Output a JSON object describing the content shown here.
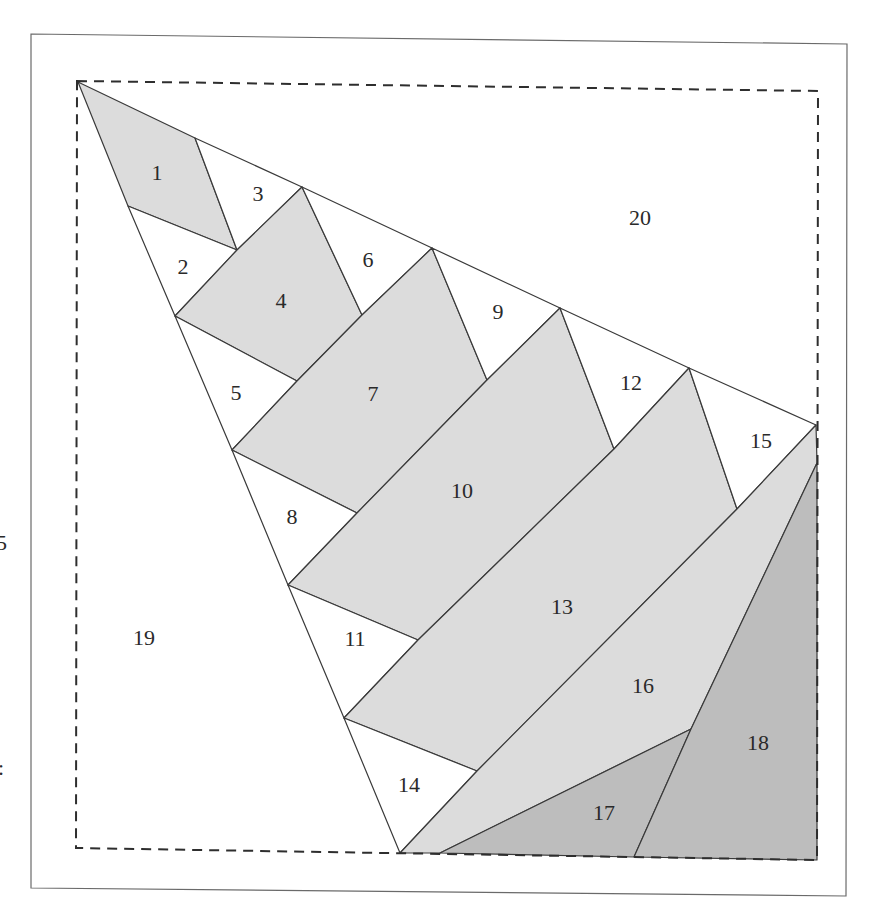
{
  "colors": {
    "white": "#ffffff",
    "light_gray": "#dcdcdc",
    "dark_gray": "#bdbdbd",
    "line": "#3a3a3a",
    "frame": "#6a6a6a"
  },
  "frame": {
    "points": [
      [
        31,
        34
      ],
      [
        847,
        44
      ],
      [
        846,
        896
      ],
      [
        31,
        888
      ]
    ]
  },
  "dashed_square": {
    "points": [
      [
        77,
        81
      ],
      [
        818,
        91
      ],
      [
        817,
        860
      ],
      [
        76,
        848
      ]
    ]
  },
  "edge_glyphs": [
    {
      "text": "5",
      "x": -4,
      "y": 550
    },
    {
      "text": ":",
      "x": -2,
      "y": 775
    }
  ],
  "pieces": [
    {
      "id": "1",
      "label": "1",
      "fill": "light_gray",
      "points": [
        [
          78,
          82
        ],
        [
          195,
          138
        ],
        [
          237,
          250
        ],
        [
          128,
          206
        ]
      ],
      "lx": 157,
      "ly": 172
    },
    {
      "id": "2",
      "label": "2",
      "fill": "white",
      "points": [
        [
          128,
          206
        ],
        [
          237,
          250
        ],
        [
          175,
          316
        ]
      ],
      "lx": 183,
      "ly": 266
    },
    {
      "id": "3",
      "label": "3",
      "fill": "white",
      "points": [
        [
          195,
          138
        ],
        [
          302,
          187
        ],
        [
          237,
          250
        ]
      ],
      "lx": 258,
      "ly": 193
    },
    {
      "id": "4",
      "label": "4",
      "fill": "light_gray",
      "points": [
        [
          175,
          316
        ],
        [
          237,
          250
        ],
        [
          302,
          187
        ],
        [
          362,
          315
        ],
        [
          297,
          381
        ]
      ],
      "lx": 281,
      "ly": 300
    },
    {
      "id": "5",
      "label": "5",
      "fill": "white",
      "points": [
        [
          175,
          316
        ],
        [
          297,
          381
        ],
        [
          232,
          450
        ]
      ],
      "lx": 236,
      "ly": 392
    },
    {
      "id": "6",
      "label": "6",
      "fill": "white",
      "points": [
        [
          302,
          187
        ],
        [
          432,
          248
        ],
        [
          362,
          315
        ]
      ],
      "lx": 368,
      "ly": 259
    },
    {
      "id": "7",
      "label": "7",
      "fill": "light_gray",
      "points": [
        [
          232,
          450
        ],
        [
          297,
          381
        ],
        [
          362,
          315
        ],
        [
          432,
          248
        ],
        [
          487,
          380
        ],
        [
          357,
          513
        ]
      ],
      "lx": 373,
      "ly": 393
    },
    {
      "id": "8",
      "label": "8",
      "fill": "white",
      "points": [
        [
          232,
          450
        ],
        [
          357,
          513
        ],
        [
          288,
          585
        ]
      ],
      "lx": 292,
      "ly": 516
    },
    {
      "id": "9",
      "label": "9",
      "fill": "white",
      "points": [
        [
          432,
          248
        ],
        [
          560,
          308
        ],
        [
          487,
          380
        ]
      ],
      "lx": 498,
      "ly": 311
    },
    {
      "id": "10",
      "label": "10",
      "fill": "light_gray",
      "points": [
        [
          288,
          585
        ],
        [
          357,
          513
        ],
        [
          487,
          380
        ],
        [
          560,
          308
        ],
        [
          614,
          449
        ],
        [
          418,
          640
        ]
      ],
      "lx": 462,
      "ly": 490
    },
    {
      "id": "11",
      "label": "11",
      "fill": "white",
      "points": [
        [
          288,
          585
        ],
        [
          418,
          640
        ],
        [
          344,
          718
        ]
      ],
      "lx": 355,
      "ly": 638
    },
    {
      "id": "12",
      "label": "12",
      "fill": "white",
      "points": [
        [
          560,
          308
        ],
        [
          689,
          368
        ],
        [
          614,
          449
        ]
      ],
      "lx": 631,
      "ly": 382
    },
    {
      "id": "13",
      "label": "13",
      "fill": "light_gray",
      "points": [
        [
          344,
          718
        ],
        [
          418,
          640
        ],
        [
          614,
          449
        ],
        [
          689,
          368
        ],
        [
          737,
          509
        ],
        [
          477,
          771
        ]
      ],
      "lx": 562,
      "ly": 606
    },
    {
      "id": "14",
      "label": "14",
      "fill": "white",
      "points": [
        [
          344,
          718
        ],
        [
          477,
          771
        ],
        [
          400,
          853
        ]
      ],
      "lx": 409,
      "ly": 784
    },
    {
      "id": "15",
      "label": "15",
      "fill": "white",
      "points": [
        [
          689,
          368
        ],
        [
          816,
          425
        ],
        [
          737,
          509
        ]
      ],
      "lx": 761,
      "ly": 440
    },
    {
      "id": "16",
      "label": "16",
      "fill": "light_gray",
      "points": [
        [
          400,
          853
        ],
        [
          477,
          771
        ],
        [
          737,
          509
        ],
        [
          816,
          425
        ],
        [
          817,
          463
        ],
        [
          691,
          729
        ],
        [
          440,
          853
        ]
      ],
      "lx": 643,
      "ly": 685
    },
    {
      "id": "17",
      "label": "17",
      "fill": "dark_gray",
      "points": [
        [
          440,
          853
        ],
        [
          691,
          729
        ],
        [
          634,
          857
        ]
      ],
      "lx": 604,
      "ly": 812
    },
    {
      "id": "18",
      "label": "18",
      "fill": "dark_gray",
      "points": [
        [
          691,
          729
        ],
        [
          817,
          463
        ],
        [
          817,
          860
        ],
        [
          634,
          857
        ]
      ],
      "lx": 758,
      "ly": 742
    },
    {
      "id": "19",
      "label": "19",
      "fill": "white",
      "points": [],
      "lx": 144,
      "ly": 637
    },
    {
      "id": "20",
      "label": "20",
      "fill": "white",
      "points": [],
      "lx": 640,
      "ly": 217
    }
  ]
}
